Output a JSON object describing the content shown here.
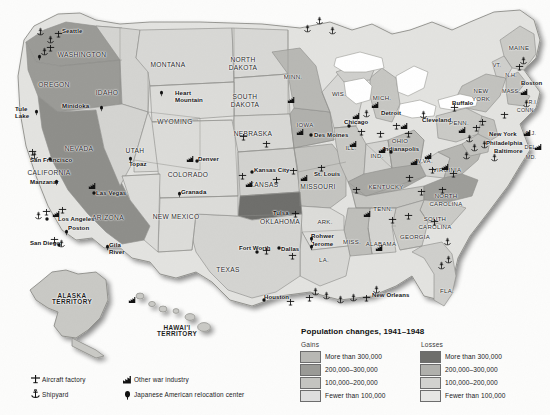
{
  "map": {
    "title": "United States Population Changes and War Industry, 1941-1948",
    "states": [
      {
        "name": "WASHINGTON",
        "x": 82,
        "y": 52,
        "cls": "state"
      },
      {
        "name": "OREGON",
        "x": 54,
        "y": 82,
        "cls": "state"
      },
      {
        "name": "IDAHO",
        "x": 107,
        "y": 90,
        "cls": "state"
      },
      {
        "name": "MONTANA",
        "x": 168,
        "y": 62,
        "cls": "state"
      },
      {
        "name": "NORTH",
        "x": 243,
        "y": 57,
        "cls": "state"
      },
      {
        "name": "DAKOTA",
        "x": 243,
        "y": 65,
        "cls": "state"
      },
      {
        "name": "SOUTH",
        "x": 245,
        "y": 94,
        "cls": "state"
      },
      {
        "name": "DAKOTA",
        "x": 245,
        "y": 102,
        "cls": "state"
      },
      {
        "name": "WYOMING",
        "x": 175,
        "y": 119,
        "cls": "state"
      },
      {
        "name": "NEBRASKA",
        "x": 253,
        "y": 131,
        "cls": "state"
      },
      {
        "name": "NEVADA",
        "x": 79,
        "y": 146,
        "cls": "state"
      },
      {
        "name": "UTAH",
        "x": 135,
        "y": 148,
        "cls": "state"
      },
      {
        "name": "CALIFORNIA",
        "x": 49,
        "y": 170,
        "cls": "state"
      },
      {
        "name": "COLORADO",
        "x": 188,
        "y": 172,
        "cls": "state"
      },
      {
        "name": "KANSAS",
        "x": 264,
        "y": 182,
        "cls": "state"
      },
      {
        "name": "MISSOURI",
        "x": 318,
        "y": 184,
        "cls": "state"
      },
      {
        "name": "ARIZONA",
        "x": 108,
        "y": 215,
        "cls": "state"
      },
      {
        "name": "NEW MEXICO",
        "x": 176,
        "y": 214,
        "cls": "state"
      },
      {
        "name": "OKLAHOMA",
        "x": 280,
        "y": 219,
        "cls": "state"
      },
      {
        "name": "ARK.",
        "x": 325,
        "y": 219,
        "cls": "state2"
      },
      {
        "name": "TEXAS",
        "x": 228,
        "y": 267,
        "cls": "state"
      },
      {
        "name": "MISS.",
        "x": 352,
        "y": 239,
        "cls": "state2"
      },
      {
        "name": "ALABAMA",
        "x": 381,
        "y": 241,
        "cls": "state2"
      },
      {
        "name": "GEORGIA",
        "x": 415,
        "y": 234,
        "cls": "state2"
      },
      {
        "name": "LA.",
        "x": 324,
        "y": 257,
        "cls": "state2"
      },
      {
        "name": "FLA.",
        "x": 447,
        "y": 288,
        "cls": "state2"
      },
      {
        "name": "TENN.",
        "x": 383,
        "y": 206,
        "cls": "state2"
      },
      {
        "name": "KENTUCKY",
        "x": 386,
        "y": 184,
        "cls": "state2"
      },
      {
        "name": "SOUTH",
        "x": 435,
        "y": 216,
        "cls": "state2"
      },
      {
        "name": "CAROLINA",
        "x": 435,
        "y": 224,
        "cls": "state2"
      },
      {
        "name": "NORTH",
        "x": 446,
        "y": 193,
        "cls": "state2"
      },
      {
        "name": "CAROLINA",
        "x": 446,
        "y": 201,
        "cls": "state2"
      },
      {
        "name": "VIRGINIA",
        "x": 447,
        "y": 167,
        "cls": "state2"
      },
      {
        "name": "W.VA.",
        "x": 424,
        "y": 158,
        "cls": "state2"
      },
      {
        "name": "OHIO",
        "x": 400,
        "y": 138,
        "cls": "state2"
      },
      {
        "name": "IND.",
        "x": 377,
        "y": 153,
        "cls": "state2"
      },
      {
        "name": "ILL.",
        "x": 351,
        "y": 145,
        "cls": "state2"
      },
      {
        "name": "IOWA",
        "x": 305,
        "y": 122,
        "cls": "state2"
      },
      {
        "name": "MINN.",
        "x": 293,
        "y": 74,
        "cls": "state2"
      },
      {
        "name": "WIS.",
        "x": 339,
        "y": 91,
        "cls": "state2"
      },
      {
        "name": "MICH.",
        "x": 382,
        "y": 95,
        "cls": "state2"
      },
      {
        "name": "PENN.",
        "x": 459,
        "y": 120,
        "cls": "state2"
      },
      {
        "name": "NEW",
        "x": 481,
        "y": 88,
        "cls": "state2"
      },
      {
        "name": "YORK",
        "x": 481,
        "y": 96,
        "cls": "state2"
      },
      {
        "name": "MAINE",
        "x": 519,
        "y": 45,
        "cls": "state2"
      },
      {
        "name": "VT.",
        "x": 497,
        "y": 63,
        "cls": "statesm"
      },
      {
        "name": "N.H.",
        "x": 511,
        "y": 73,
        "cls": "statesm"
      },
      {
        "name": "MASS.",
        "x": 511,
        "y": 89,
        "cls": "statesm"
      },
      {
        "name": "R.I.",
        "x": 533,
        "y": 100,
        "cls": "statesm"
      },
      {
        "name": "CONN.",
        "x": 526,
        "y": 108,
        "cls": "statesm"
      },
      {
        "name": "N.J.",
        "x": 531,
        "y": 131,
        "cls": "statesm"
      },
      {
        "name": "DEL.",
        "x": 531,
        "y": 145,
        "cls": "statesm"
      },
      {
        "name": "MD.",
        "x": 531,
        "y": 155,
        "cls": "statesm"
      }
    ],
    "territories": [
      {
        "line1": "ALASKA",
        "line2": "TERRITORY",
        "x": 72,
        "y": 293
      },
      {
        "line1": "HAWAI'I",
        "line2": "TERRITORY",
        "x": 177,
        "y": 325
      }
    ],
    "cities": [
      {
        "name": "Seattle",
        "x": 62,
        "y": 28
      },
      {
        "name": "San Francisco",
        "x": 30,
        "y": 157
      },
      {
        "name": "Los Angeles",
        "x": 58,
        "y": 216
      },
      {
        "name": "San Diego",
        "x": 30,
        "y": 240
      },
      {
        "name": "Las Vegas",
        "x": 96,
        "y": 190
      },
      {
        "name": "Denver",
        "x": 198,
        "y": 156
      },
      {
        "name": "Kansas City",
        "x": 254,
        "y": 167
      },
      {
        "name": "St. Louis",
        "x": 314,
        "y": 171
      },
      {
        "name": "Des Moines",
        "x": 314,
        "y": 132
      },
      {
        "name": "Chicago",
        "x": 344,
        "y": 119
      },
      {
        "name": "Detroit",
        "x": 381,
        "y": 110
      },
      {
        "name": "Cleveland",
        "x": 422,
        "y": 117
      },
      {
        "name": "Buffalo",
        "x": 452,
        "y": 100
      },
      {
        "name": "Indianapolis",
        "x": 383,
        "y": 146
      },
      {
        "name": "Tulsa",
        "x": 273,
        "y": 210
      },
      {
        "name": "Fort Worth",
        "x": 239,
        "y": 245
      },
      {
        "name": "Dallas",
        "x": 281,
        "y": 246
      },
      {
        "name": "Houston",
        "x": 264,
        "y": 294
      },
      {
        "name": "New Orleans",
        "x": 372,
        "y": 292
      },
      {
        "name": "New York",
        "x": 489,
        "y": 131
      },
      {
        "name": "Philadelphia",
        "x": 486,
        "y": 140
      },
      {
        "name": "Baltimore",
        "x": 494,
        "y": 148
      },
      {
        "name": "Boston",
        "x": 521,
        "y": 80
      }
    ],
    "relocation_camps": [
      {
        "name": "Tule",
        "x": 15,
        "y": 106
      },
      {
        "name": "Lake",
        "x": 15,
        "y": 113
      },
      {
        "name": "Minidoka",
        "x": 62,
        "y": 103
      },
      {
        "name": "Heart",
        "x": 175,
        "y": 90
      },
      {
        "name": "Mountain",
        "x": 175,
        "y": 97
      },
      {
        "name": "Topaz",
        "x": 129,
        "y": 161
      },
      {
        "name": "Manzanar",
        "x": 30,
        "y": 179
      },
      {
        "name": "Poston",
        "x": 68,
        "y": 225
      },
      {
        "name": "Gila",
        "x": 109,
        "y": 242
      },
      {
        "name": "River",
        "x": 109,
        "y": 249
      },
      {
        "name": "Granada",
        "x": 181,
        "y": 189
      },
      {
        "name": "Rohwer",
        "x": 311,
        "y": 233
      },
      {
        "name": "Jerome",
        "x": 311,
        "y": 241
      }
    ],
    "symbol_legend": {
      "items": [
        {
          "icon": "aircraft-factory-icon",
          "label": "Aircraft factory"
        },
        {
          "icon": "other-war-industry-icon",
          "label": "Other war industry"
        },
        {
          "icon": "shipyard-icon",
          "label": "Shipyard"
        },
        {
          "icon": "japanese-american-relocation-center-icon",
          "label": "Japanese American relocation center"
        }
      ]
    },
    "population_legend": {
      "title": "Population changes, 1941–1948",
      "gains_header": "Gains",
      "losses_header": "Losses",
      "gains": [
        {
          "label": "More than 300,000",
          "color": "#b8b8b4"
        },
        {
          "label": "200,000–300,000",
          "color": "#9a9a96"
        },
        {
          "label": "100,000–200,000",
          "color": "#c4c4c0"
        },
        {
          "label": "Fewer than 100,000",
          "color": "#dedede"
        }
      ],
      "losses": [
        {
          "label": "More than 300,000",
          "color": "#6e6e6b"
        },
        {
          "label": "200,000–300,000",
          "color": "#b0b0ac"
        },
        {
          "label": "100,000–200,000",
          "color": "#d2d2cf"
        },
        {
          "label": "Fewer than 100,000",
          "color": "#e6e6e4"
        }
      ]
    }
  }
}
